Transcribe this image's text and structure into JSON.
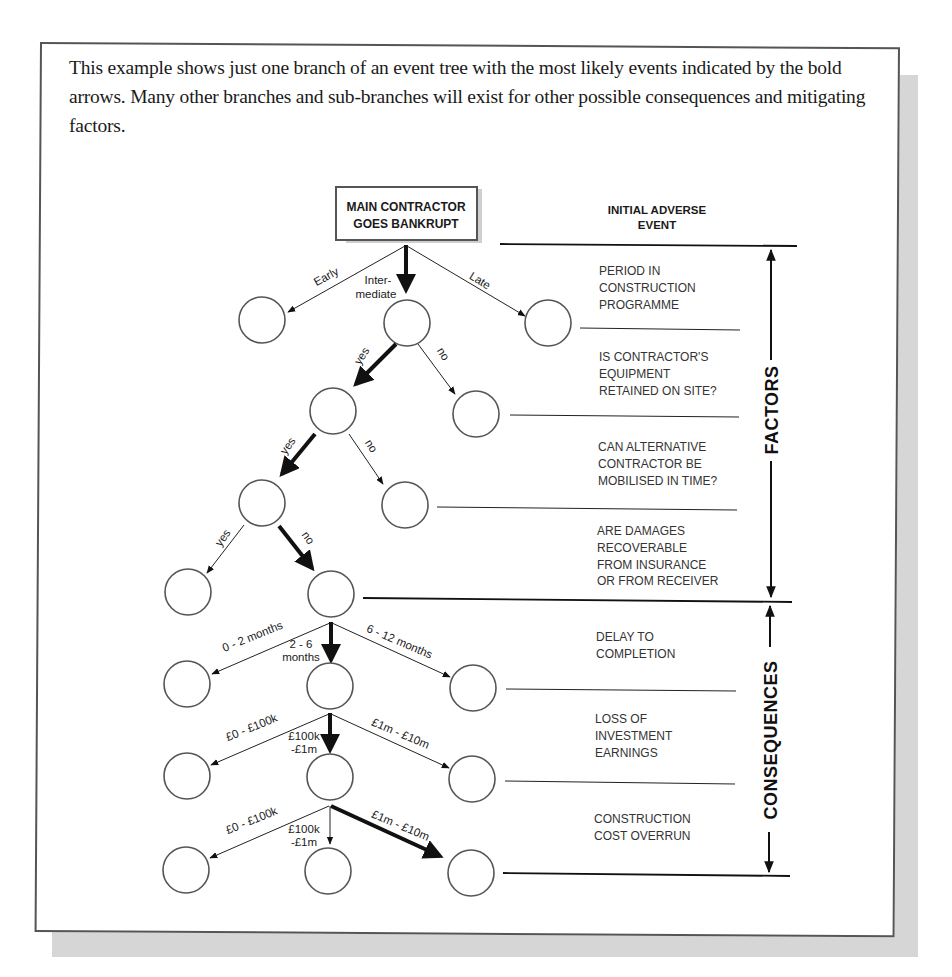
{
  "intro_text": "This example shows just one branch of an event tree with the most likely events indicated by the bold arrows. Many other branches and sub-branches will exist for other possible consequences and mitigating factors.",
  "root": {
    "line1": "MAIN CONTRACTOR",
    "line2": "GOES BANKRUPT"
  },
  "branch_labels": {
    "early": "Early",
    "intermediate_1": "Inter-",
    "intermediate_2": "mediate",
    "late": "Late",
    "equip_yes": "yes",
    "equip_no": "no",
    "alt_yes": "yes",
    "alt_no": "no",
    "dmg_yes": "yes",
    "dmg_no": "no",
    "delay_short": "0 - 2 months",
    "delay_mid_1": "2 - 6",
    "delay_mid_2": "months",
    "delay_long": "6 - 12 months",
    "earn_low": "£0 - £100k",
    "earn_mid_1": "£100k",
    "earn_mid_2": "-£1m",
    "earn_high": "£1m - £10m",
    "cost_low": "£0 - £100k",
    "cost_mid_1": "£100k",
    "cost_mid_2": "-£1m",
    "cost_high": "£1m - £10m"
  },
  "side_labels": {
    "initial": [
      "INITIAL ADVERSE",
      "EVENT"
    ],
    "period": [
      "PERIOD IN",
      "CONSTRUCTION",
      "PROGRAMME"
    ],
    "equipment": [
      "IS CONTRACTOR'S",
      "EQUIPMENT",
      "RETAINED ON SITE?"
    ],
    "alternative": [
      "CAN ALTERNATIVE",
      "CONTRACTOR BE",
      "MOBILISED IN TIME?"
    ],
    "damages": [
      "ARE DAMAGES",
      "RECOVERABLE",
      "FROM INSURANCE",
      "OR FROM RECEIVER"
    ],
    "delay": [
      "DELAY TO",
      "COMPLETION"
    ],
    "earnings": [
      "LOSS OF",
      "INVESTMENT",
      "EARNINGS"
    ],
    "cost": [
      "CONSTRUCTION",
      "COST OVERRUN"
    ]
  },
  "sections": {
    "factors": "FACTORS",
    "consequences": "CONSEQUENCES"
  }
}
